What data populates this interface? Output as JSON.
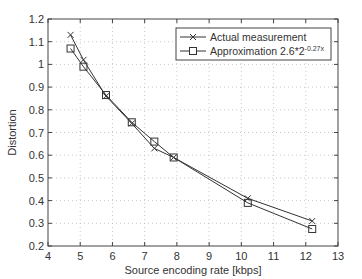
{
  "chart_data": {
    "type": "line",
    "title": "",
    "xlabel": "Source encoding rate [kbps]",
    "ylabel": "Distortion",
    "xlim": [
      4,
      13
    ],
    "ylim": [
      0.2,
      1.2
    ],
    "xticks": [
      4,
      5,
      6,
      7,
      8,
      9,
      10,
      11,
      12,
      13
    ],
    "yticks": [
      0.2,
      0.3,
      0.4,
      0.5,
      0.6,
      0.7,
      0.8,
      0.9,
      1,
      1.1,
      1.2
    ],
    "xtick_labels": [
      "4",
      "5",
      "6",
      "7",
      "8",
      "9",
      "10",
      "11",
      "12",
      "13"
    ],
    "ytick_labels": [
      "0.2",
      "0.3",
      "0.4",
      "0.5",
      "0.6",
      "0.7",
      "0.8",
      "0.9",
      "1",
      "1.1",
      "1.2"
    ],
    "grid": true,
    "legend_position": "top-right",
    "series": [
      {
        "name": "Actual measurement",
        "marker": "x",
        "x": [
          4.7,
          5.1,
          5.8,
          6.6,
          7.3,
          7.9,
          10.2,
          12.2
        ],
        "y": [
          1.13,
          1.02,
          0.86,
          0.74,
          0.63,
          0.59,
          0.41,
          0.31
        ]
      },
      {
        "name": "Approximation 2.6*2",
        "name_superscript": "-0.27x",
        "marker": "square",
        "x": [
          4.7,
          5.1,
          5.8,
          6.6,
          7.3,
          7.9,
          10.2,
          12.2
        ],
        "y": [
          1.07,
          0.99,
          0.865,
          0.745,
          0.66,
          0.59,
          0.39,
          0.275
        ]
      }
    ],
    "colors": {
      "line": "#333333",
      "grid": "#bbbbbb",
      "axis": "#444444"
    }
  }
}
